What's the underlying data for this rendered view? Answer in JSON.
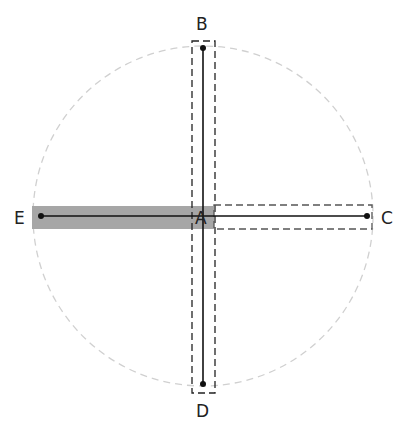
{
  "diagram": {
    "circle": {
      "cx": 203,
      "cy": 216,
      "r": 170,
      "stroke": "#d0d0d0"
    },
    "points": {
      "A": {
        "label": "A",
        "x": 203,
        "y": 216
      },
      "B": {
        "label": "B",
        "x": 203,
        "y": 48
      },
      "C": {
        "label": "C",
        "x": 367,
        "y": 216
      },
      "D": {
        "label": "D",
        "x": 203,
        "y": 384
      },
      "E": {
        "label": "E",
        "x": 41,
        "y": 216
      }
    },
    "highlight_color": "#a6a6a6",
    "line_color": "#111111"
  }
}
